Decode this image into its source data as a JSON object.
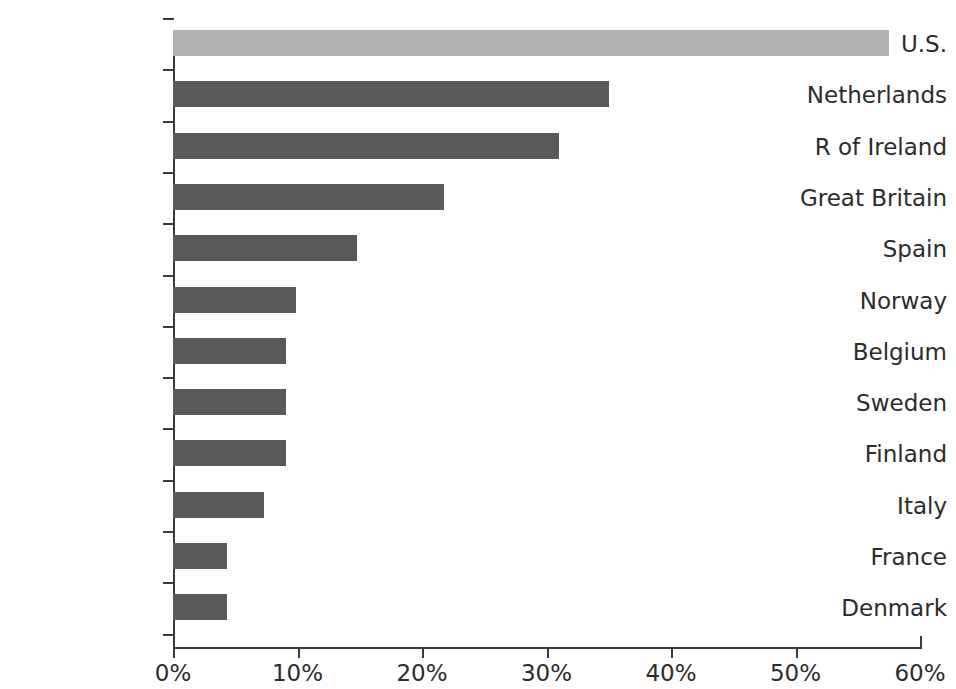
{
  "chart_data": {
    "type": "bar",
    "orientation": "horizontal",
    "title": "",
    "xlabel": "",
    "ylabel": "",
    "xlim": [
      0,
      60
    ],
    "grid": false,
    "legend": false,
    "tick_suffix": "%",
    "categories": [
      "U.S.",
      "Netherlands",
      "R of Ireland",
      "Great Britain",
      "Spain",
      "Norway",
      "Belgium",
      "Sweden",
      "Finland",
      "Italy",
      "France",
      "Denmark"
    ],
    "values": [
      57.5,
      35.0,
      31.0,
      21.8,
      14.8,
      9.9,
      9.1,
      9.1,
      9.1,
      7.3,
      4.3,
      4.3
    ],
    "x_tick_labels": [
      "0%",
      "10%",
      "20%",
      "30%",
      "40%",
      "50%",
      "60%"
    ],
    "x_tick_values": [
      0,
      10,
      20,
      30,
      40,
      50,
      60
    ],
    "bar_colors": [
      "#b2b2b2",
      "#595959",
      "#595959",
      "#595959",
      "#595959",
      "#595959",
      "#595959",
      "#595959",
      "#595959",
      "#595959",
      "#595959",
      "#595959"
    ],
    "highlight_category": "U.S.",
    "highlight_color": "#b2b2b2",
    "series_color": "#595959",
    "axis_color": "#3a3a3a",
    "text_color": "#2b2b2b",
    "background_color": "#ffffff"
  }
}
